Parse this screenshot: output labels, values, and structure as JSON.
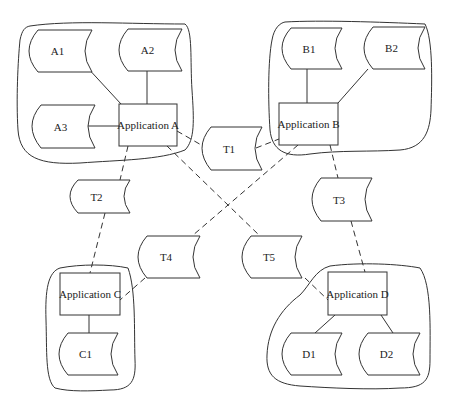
{
  "diagram": {
    "applications": [
      {
        "id": "A",
        "label": "Application A"
      },
      {
        "id": "B",
        "label": "Application B"
      },
      {
        "id": "C",
        "label": "Application C"
      },
      {
        "id": "D",
        "label": "Application D"
      }
    ],
    "stores": {
      "A1": "A1",
      "A2": "A2",
      "A3": "A3",
      "B1": "B1",
      "B2": "B2",
      "C1": "C1",
      "D1": "D1",
      "D2": "D2",
      "T1": "T1",
      "T2": "T2",
      "T3": "T3",
      "T4": "T4",
      "T5": "T5"
    },
    "solid_links": [
      [
        "A1",
        "Application A"
      ],
      [
        "A2",
        "Application A"
      ],
      [
        "A3",
        "Application A"
      ],
      [
        "B1",
        "Application B"
      ],
      [
        "B2",
        "Application B"
      ],
      [
        "Application C",
        "C1"
      ],
      [
        "Application D",
        "D1"
      ],
      [
        "Application D",
        "D2"
      ]
    ],
    "dashed_links": [
      [
        "Application A",
        "T1"
      ],
      [
        "T1",
        "Application B"
      ],
      [
        "Application A",
        "T2"
      ],
      [
        "T2",
        "Application C"
      ],
      [
        "Application B",
        "T4"
      ],
      [
        "T4",
        "Application C"
      ],
      [
        "Application A",
        "T5"
      ],
      [
        "T5",
        "Application D"
      ],
      [
        "Application B",
        "T3"
      ],
      [
        "T3",
        "Application D"
      ]
    ]
  }
}
